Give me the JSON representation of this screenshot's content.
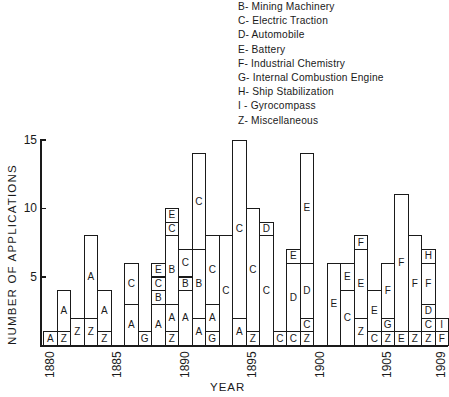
{
  "chart_data": {
    "type": "bar",
    "stacked": true,
    "title": "",
    "xlabel": "YEAR",
    "ylabel": "NUMBER OF APPLICATIONS",
    "ylim": [
      0,
      15
    ],
    "yticks": [
      5,
      10,
      15
    ],
    "xticks": [
      "1880",
      "1885",
      "1890",
      "1895",
      "1900",
      "1905",
      "1909"
    ],
    "grid": false,
    "legend_position": "top-right",
    "legend": [
      {
        "code": "B",
        "label": "Mining Machinery"
      },
      {
        "code": "C",
        "label": "Electric Traction"
      },
      {
        "code": "D",
        "label": "Automobile"
      },
      {
        "code": "E",
        "label": "Battery"
      },
      {
        "code": "F",
        "label": "Industrial Chemistry"
      },
      {
        "code": "G",
        "label": "Internal Combustion Engine"
      },
      {
        "code": "H",
        "label": "Ship Stabilization"
      },
      {
        "code": "I",
        "label": "Gyrocompass"
      },
      {
        "code": "Z",
        "label": "Miscellaneous"
      }
    ],
    "categories": [
      "1880",
      "1881",
      "1882",
      "1883",
      "1884",
      "1885",
      "1886",
      "1887",
      "1888",
      "1889",
      "1890",
      "1891",
      "1892",
      "1893",
      "1894",
      "1895",
      "1896",
      "1897",
      "1898",
      "1899",
      "1900",
      "1901",
      "1902",
      "1903",
      "1904",
      "1905",
      "1906",
      "1907",
      "1908",
      "1909"
    ],
    "bars": [
      {
        "year": "1880",
        "segments": [
          {
            "code": "A",
            "value": 1
          }
        ]
      },
      {
        "year": "1881",
        "segments": [
          {
            "code": "Z",
            "value": 1
          },
          {
            "code": "A",
            "value": 3
          }
        ]
      },
      {
        "year": "1882",
        "segments": [
          {
            "code": "Z",
            "value": 2
          }
        ]
      },
      {
        "year": "1883",
        "segments": [
          {
            "code": "Z",
            "value": 2
          },
          {
            "code": "A",
            "value": 6
          }
        ]
      },
      {
        "year": "1884",
        "segments": [
          {
            "code": "Z",
            "value": 1
          },
          {
            "code": "A",
            "value": 3
          }
        ]
      },
      {
        "year": "1885",
        "segments": []
      },
      {
        "year": "1886",
        "segments": [
          {
            "code": "A",
            "value": 3
          },
          {
            "code": "C",
            "value": 3
          }
        ]
      },
      {
        "year": "1887",
        "segments": [
          {
            "code": "G",
            "value": 1
          }
        ]
      },
      {
        "year": "1888",
        "segments": [
          {
            "code": "A",
            "value": 3
          },
          {
            "code": "B",
            "value": 1
          },
          {
            "code": "C",
            "value": 1
          },
          {
            "code": "E",
            "value": 1
          }
        ]
      },
      {
        "year": "1889",
        "segments": [
          {
            "code": "Z",
            "value": 1
          },
          {
            "code": "A",
            "value": 2
          },
          {
            "code": "B",
            "value": 5
          },
          {
            "code": "C",
            "value": 1
          },
          {
            "code": "E",
            "value": 1
          }
        ]
      },
      {
        "year": "1890",
        "segments": [
          {
            "code": "A",
            "value": 4
          },
          {
            "code": "B",
            "value": 1
          },
          {
            "code": "C",
            "value": 2
          }
        ]
      },
      {
        "year": "1891",
        "segments": [
          {
            "code": "A",
            "value": 2
          },
          {
            "code": "B",
            "value": 5
          },
          {
            "code": "C",
            "value": 7
          }
        ]
      },
      {
        "year": "1892",
        "segments": [
          {
            "code": "G",
            "value": 1
          },
          {
            "code": "A",
            "value": 2
          },
          {
            "code": "C",
            "value": 5
          }
        ]
      },
      {
        "year": "1893",
        "segments": [
          {
            "code": "C",
            "value": 8
          }
        ]
      },
      {
        "year": "1894",
        "segments": [
          {
            "code": "A",
            "value": 2
          },
          {
            "code": "C",
            "value": 13
          }
        ]
      },
      {
        "year": "1895",
        "segments": [
          {
            "code": "Z",
            "value": 1
          },
          {
            "code": "C",
            "value": 9
          }
        ]
      },
      {
        "year": "1896",
        "segments": [
          {
            "code": "C",
            "value": 8
          },
          {
            "code": "D",
            "value": 1
          }
        ]
      },
      {
        "year": "1897",
        "segments": [
          {
            "code": "C",
            "value": 1
          }
        ]
      },
      {
        "year": "1898",
        "segments": [
          {
            "code": "C",
            "value": 1
          },
          {
            "code": "D",
            "value": 5
          },
          {
            "code": "E",
            "value": 1
          }
        ]
      },
      {
        "year": "1899",
        "segments": [
          {
            "code": "Z",
            "value": 1
          },
          {
            "code": "C",
            "value": 1
          },
          {
            "code": "D",
            "value": 4
          },
          {
            "code": "E",
            "value": 8
          }
        ]
      },
      {
        "year": "1900",
        "segments": []
      },
      {
        "year": "1901",
        "segments": [
          {
            "code": "E",
            "value": 6
          }
        ]
      },
      {
        "year": "1902",
        "segments": [
          {
            "code": "C",
            "value": 4
          },
          {
            "code": "E",
            "value": 2
          }
        ]
      },
      {
        "year": "1903",
        "segments": [
          {
            "code": "Z",
            "value": 2
          },
          {
            "code": "E",
            "value": 5
          },
          {
            "code": "F",
            "value": 1
          }
        ]
      },
      {
        "year": "1904",
        "segments": [
          {
            "code": "C",
            "value": 1
          },
          {
            "code": "E",
            "value": 3
          }
        ]
      },
      {
        "year": "1905",
        "segments": [
          {
            "code": "Z",
            "value": 1
          },
          {
            "code": "G",
            "value": 1
          },
          {
            "code": "F",
            "value": 4
          }
        ]
      },
      {
        "year": "1906",
        "segments": [
          {
            "code": "E",
            "value": 1
          },
          {
            "code": "F",
            "value": 10
          }
        ]
      },
      {
        "year": "1907",
        "segments": [
          {
            "code": "Z",
            "value": 1
          },
          {
            "code": "F",
            "value": 7
          }
        ]
      },
      {
        "year": "1908",
        "segments": [
          {
            "code": "Z",
            "value": 1
          },
          {
            "code": "C",
            "value": 1
          },
          {
            "code": "D",
            "value": 1
          },
          {
            "code": "F",
            "value": 3
          },
          {
            "code": "H",
            "value": 1
          }
        ]
      },
      {
        "year": "1909",
        "segments": [
          {
            "code": "F",
            "value": 1
          },
          {
            "code": "I",
            "value": 1
          }
        ]
      }
    ],
    "totals": [
      1,
      4,
      2,
      8,
      4,
      0,
      6,
      1,
      6,
      10,
      7,
      14,
      8,
      8,
      15,
      10,
      9,
      1,
      7,
      14,
      0,
      6,
      6,
      8,
      4,
      6,
      11,
      8,
      7,
      2
    ]
  },
  "legend_items": [
    "B- Mining Machinery",
    "C- Electric Traction",
    "D- Automobile",
    "E- Battery",
    "F- Industrial Chemistry",
    "G- Internal Combustion Engine",
    "H- Ship Stabilization",
    "I - Gyrocompass",
    "Z- Miscellaneous"
  ]
}
